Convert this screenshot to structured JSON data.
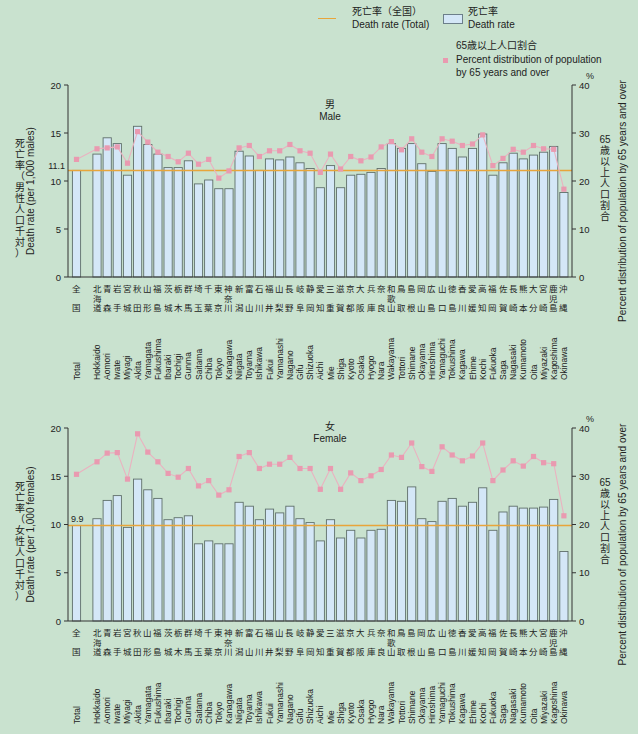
{
  "legend": {
    "total_line_jp": "死亡率（全国）",
    "total_line_en": "Death rate (Total)",
    "bar_jp": "死亡率",
    "bar_en": "Death rate",
    "marker_jp": "65歳以上人口割合",
    "marker_en_1": "Percent distribution of population",
    "marker_en_2": "by 65 years and over"
  },
  "colors": {
    "background": "#c9e2cf",
    "bar_fill": "#d4e7f7",
    "bar_stroke": "#5f6f6a",
    "total_line": "#e8a53a",
    "marker": "#e99ab0",
    "marker_line": "#eab2c0",
    "axis": "#333333"
  },
  "axes": {
    "left_title_jp_male": "死亡率（男性人口千対）",
    "left_title_en_male": "Death rate (per 1,000 males)",
    "left_title_jp_female": "死亡率（女性人口千対）",
    "left_title_en_female": "Death rate (per 1,000 females)",
    "right_title_jp": "65歳以上人口割合",
    "right_title_en": "Percent distribution of population by 65 years and over",
    "right_unit": "%",
    "left_ticks": [
      "0",
      "5",
      "10",
      "15",
      "20"
    ],
    "right_ticks": [
      "0",
      "10",
      "20",
      "30",
      "40"
    ]
  },
  "categories_jp": [
    [
      "全",
      "国"
    ],
    [
      "北",
      "海",
      "道"
    ],
    [
      "青",
      "森"
    ],
    [
      "岩",
      "手"
    ],
    [
      "宮",
      "城"
    ],
    [
      "秋",
      "田"
    ],
    [
      "山",
      "形"
    ],
    [
      "福",
      "島"
    ],
    [
      "茨",
      "城"
    ],
    [
      "栃",
      "木"
    ],
    [
      "群",
      "馬"
    ],
    [
      "埼",
      "玉"
    ],
    [
      "千",
      "葉"
    ],
    [
      "東",
      "京"
    ],
    [
      "神",
      "奈",
      "川"
    ],
    [
      "新",
      "潟"
    ],
    [
      "富",
      "山"
    ],
    [
      "石",
      "川"
    ],
    [
      "福",
      "井"
    ],
    [
      "山",
      "梨"
    ],
    [
      "長",
      "野"
    ],
    [
      "岐",
      "阜"
    ],
    [
      "静",
      "岡"
    ],
    [
      "愛",
      "知"
    ],
    [
      "三",
      "重"
    ],
    [
      "滋",
      "賀"
    ],
    [
      "京",
      "都"
    ],
    [
      "大",
      "阪"
    ],
    [
      "兵",
      "庫"
    ],
    [
      "奈",
      "良"
    ],
    [
      "和",
      "歌",
      "山"
    ],
    [
      "鳥",
      "取"
    ],
    [
      "島",
      "根"
    ],
    [
      "岡",
      "山"
    ],
    [
      "広",
      "島"
    ],
    [
      "山",
      "口"
    ],
    [
      "徳",
      "島"
    ],
    [
      "香",
      "川"
    ],
    [
      "愛",
      "媛"
    ],
    [
      "高",
      "知"
    ],
    [
      "福",
      "岡"
    ],
    [
      "佐",
      "賀"
    ],
    [
      "長",
      "崎"
    ],
    [
      "熊",
      "本"
    ],
    [
      "大",
      "分"
    ],
    [
      "宮",
      "崎"
    ],
    [
      "鹿",
      "児",
      "島"
    ],
    [
      "沖",
      "縄"
    ]
  ],
  "chart_data": [
    {
      "type": "bar",
      "title": "男 Male",
      "title_jp": "男",
      "title_en": "Male",
      "categories": [
        "Total",
        "Hokkaido",
        "Aomori",
        "Iwate",
        "Miyagi",
        "Akita",
        "Yamagata",
        "Fukushima",
        "Ibaraki",
        "Tochigi",
        "Gunma",
        "Saitama",
        "Chiba",
        "Tokyo",
        "Kanagawa",
        "Niigata",
        "Toyama",
        "Ishikawa",
        "Fukui",
        "Yamanashi",
        "Nagano",
        "Gifu",
        "Shizuoka",
        "Aichi",
        "Mie",
        "Shiga",
        "Kyoto",
        "Osaka",
        "Hyogo",
        "Nara",
        "Wakayama",
        "Tottori",
        "Shimane",
        "Okayama",
        "Hiroshima",
        "Yamaguchi",
        "Tokushima",
        "Kagawa",
        "Ehime",
        "Kochi",
        "Fukuoka",
        "Saga",
        "Nagasaki",
        "Kumamoto",
        "Oita",
        "Miyazaki",
        "Kagoshima",
        "Okinawa"
      ],
      "series": [
        {
          "name": "Death rate",
          "axis": "left",
          "kind": "bar",
          "values": [
            11.1,
            12.8,
            14.5,
            13.9,
            10.6,
            15.7,
            13.8,
            12.8,
            11.4,
            11.4,
            12.1,
            9.7,
            10.1,
            9.2,
            9.2,
            13.1,
            12.6,
            11.1,
            12.3,
            12.2,
            12.5,
            11.9,
            11.3,
            9.3,
            11.6,
            9.3,
            10.6,
            10.7,
            10.9,
            11.3,
            13.9,
            13.4,
            13.9,
            11.8,
            11.0,
            13.9,
            13.4,
            12.5,
            13.4,
            14.9,
            10.6,
            11.9,
            12.9,
            12.3,
            12.7,
            13.0,
            13.6,
            8.8
          ]
        },
        {
          "name": "Percent distribution of population by 65 years and over",
          "axis": "right",
          "kind": "line-marker",
          "values": [
            24.5,
            26.7,
            26.9,
            27.1,
            23.7,
            30.3,
            28.1,
            26.0,
            25.1,
            24.0,
            25.8,
            23.5,
            24.5,
            20.6,
            22.1,
            26.9,
            27.4,
            25.1,
            26.3,
            26.3,
            27.6,
            26.3,
            25.8,
            21.8,
            25.6,
            22.5,
            25.1,
            24.2,
            25.0,
            27.1,
            28.2,
            26.5,
            28.8,
            26.0,
            25.1,
            28.8,
            28.3,
            27.4,
            27.7,
            29.6,
            23.2,
            24.7,
            26.6,
            26.0,
            27.4,
            26.7,
            26.6,
            18.3
          ]
        },
        {
          "name": "Death rate (Total)",
          "axis": "left",
          "kind": "hline",
          "value": 11.1,
          "label": "11.1"
        }
      ],
      "xlabel": "",
      "ylabel": "Death rate (per 1,000 males)",
      "ylabel_right": "Percent distribution of population by 65 years and over",
      "ylim": [
        0,
        20
      ],
      "ylim_right": [
        0,
        40
      ],
      "yticks": [
        0,
        5,
        10,
        15,
        20
      ],
      "yticks_right": [
        0,
        10,
        20,
        30,
        40
      ],
      "grid": false,
      "legend_position": "top-right"
    },
    {
      "type": "bar",
      "title": "女 Female",
      "title_jp": "女",
      "title_en": "Female",
      "categories": [
        "Total",
        "Hokkaido",
        "Aomori",
        "Iwate",
        "Miyagi",
        "Akita",
        "Yamagata",
        "Fukushima",
        "Ibaraki",
        "Tochigi",
        "Gunma",
        "Saitama",
        "Chiba",
        "Tokyo",
        "Kanagawa",
        "Niigata",
        "Toyama",
        "Ishikawa",
        "Fukui",
        "Yamanashi",
        "Nagano",
        "Gifu",
        "Shizuoka",
        "Aichi",
        "Mie",
        "Shiga",
        "Kyoto",
        "Osaka",
        "Hyogo",
        "Nara",
        "Wakayama",
        "Tottori",
        "Shimane",
        "Okayama",
        "Hiroshima",
        "Yamaguchi",
        "Tokushima",
        "Kagawa",
        "Ehime",
        "Kochi",
        "Fukuoka",
        "Saga",
        "Nagasaki",
        "Kumamoto",
        "Oita",
        "Miyazaki",
        "Kagoshima",
        "Okinawa"
      ],
      "series": [
        {
          "name": "Death rate",
          "axis": "left",
          "kind": "bar",
          "values": [
            9.9,
            10.6,
            12.5,
            13.0,
            9.7,
            14.7,
            13.6,
            12.7,
            10.5,
            10.7,
            10.9,
            8.0,
            8.3,
            8.0,
            8.0,
            12.3,
            11.9,
            10.5,
            11.6,
            11.2,
            11.9,
            10.6,
            10.2,
            8.3,
            10.5,
            8.6,
            9.4,
            8.6,
            9.4,
            9.5,
            12.5,
            12.4,
            13.9,
            10.6,
            10.3,
            12.4,
            12.7,
            11.9,
            12.3,
            13.8,
            9.4,
            11.3,
            11.9,
            11.7,
            11.7,
            11.8,
            12.6,
            7.2
          ]
        },
        {
          "name": "Percent distribution of population by 65 years and over",
          "axis": "right",
          "kind": "line-marker",
          "values": [
            30.4,
            33.0,
            34.8,
            34.9,
            29.4,
            38.8,
            35.0,
            33.0,
            30.6,
            29.8,
            31.6,
            28.0,
            29.1,
            26.1,
            27.2,
            34.1,
            34.9,
            31.6,
            32.5,
            32.5,
            33.9,
            31.6,
            31.6,
            27.3,
            31.6,
            27.3,
            30.7,
            29.1,
            30.1,
            31.4,
            34.4,
            33.9,
            36.9,
            32.0,
            31.0,
            36.1,
            34.4,
            33.2,
            34.2,
            36.9,
            29.1,
            31.3,
            33.2,
            32.1,
            34.1,
            32.8,
            32.6,
            21.8
          ]
        },
        {
          "name": "Death rate (Total)",
          "axis": "left",
          "kind": "hline",
          "value": 9.9,
          "label": "9.9"
        }
      ],
      "xlabel": "",
      "ylabel": "Death rate (per 1,000 females)",
      "ylabel_right": "Percent distribution of population by 65 years and over",
      "ylim": [
        0,
        20
      ],
      "ylim_right": [
        0,
        40
      ],
      "yticks": [
        0,
        5,
        10,
        15,
        20
      ],
      "yticks_right": [
        0,
        10,
        20,
        30,
        40
      ],
      "grid": false,
      "legend_position": "top-right"
    }
  ]
}
